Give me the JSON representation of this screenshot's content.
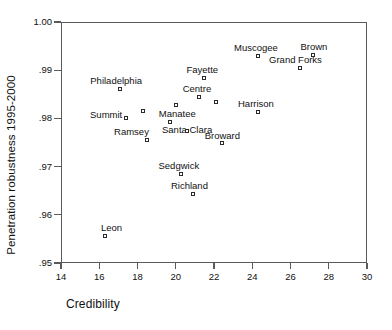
{
  "chart_data": {
    "type": "scatter",
    "title": "",
    "xlabel": "Credibility",
    "ylabel": "Penetration robustness 1995-2000",
    "xlim": [
      14,
      30
    ],
    "ylim": [
      0.95,
      1.0
    ],
    "xticks": [
      "14",
      "16",
      "18",
      "20",
      "22",
      "24",
      "26",
      "28",
      "30"
    ],
    "xtick_values": [
      14,
      16,
      18,
      20,
      22,
      24,
      26,
      28,
      30
    ],
    "yticks": [
      ".95",
      ".96",
      ".97",
      ".98",
      ".99",
      "1.00"
    ],
    "ytick_values": [
      0.95,
      0.96,
      0.97,
      0.98,
      0.99,
      1.0
    ],
    "grid": false,
    "legend": false,
    "marker": "open-square",
    "points": [
      {
        "label": "Leon",
        "x": 16.3,
        "y": 0.9555,
        "lx": -4,
        "ly": -13
      },
      {
        "label": "Philadelphia",
        "x": 17.1,
        "y": 0.9862,
        "lx": -30,
        "ly": -13
      },
      {
        "label": "Summit",
        "x": 17.4,
        "y": 0.98,
        "lx": -36,
        "ly": -8
      },
      {
        "label": "",
        "x": 18.3,
        "y": 0.9815,
        "lx": 0,
        "ly": 0
      },
      {
        "label": "Ramsey",
        "x": 18.5,
        "y": 0.9756,
        "lx": -33,
        "ly": -13
      },
      {
        "label": "Manatee",
        "x": 20.0,
        "y": 0.9827,
        "lx": -17,
        "ly": 4
      },
      {
        "label": "Santa Clara",
        "x": 19.7,
        "y": 0.9792,
        "lx": -8,
        "ly": 3
      },
      {
        "label": "",
        "x": 20.6,
        "y": 0.9773,
        "lx": 0,
        "ly": 0
      },
      {
        "label": "Sedgwick",
        "x": 20.3,
        "y": 0.9685,
        "lx": -23,
        "ly": -13
      },
      {
        "label": "Richland",
        "x": 20.9,
        "y": 0.9644,
        "lx": -22,
        "ly": -13
      },
      {
        "label": "Fayette",
        "x": 21.5,
        "y": 0.9883,
        "lx": -18,
        "ly": -13
      },
      {
        "label": "Centre",
        "x": 21.2,
        "y": 0.9845,
        "lx": -16,
        "ly": -13
      },
      {
        "label": "",
        "x": 22.1,
        "y": 0.9835,
        "lx": 0,
        "ly": 0
      },
      {
        "label": "Broward",
        "x": 22.4,
        "y": 0.9748,
        "lx": -17,
        "ly": -12
      },
      {
        "label": "Harrison",
        "x": 24.3,
        "y": 0.9813,
        "lx": -20,
        "ly": -13
      },
      {
        "label": "Muscogee",
        "x": 24.3,
        "y": 0.993,
        "lx": -24,
        "ly": -13
      },
      {
        "label": "Grand Forks",
        "x": 26.5,
        "y": 0.9904,
        "lx": -31,
        "ly": -13
      },
      {
        "label": "Brown",
        "x": 27.2,
        "y": 0.9932,
        "lx": -13,
        "ly": -13
      }
    ]
  }
}
